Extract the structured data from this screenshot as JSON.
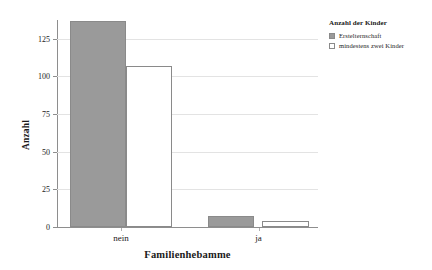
{
  "chart_data": {
    "type": "bar",
    "title": "",
    "xlabel": "Familienhebamme",
    "ylabel": "Anzahl",
    "categories": [
      "nein",
      "ja"
    ],
    "series": [
      {
        "name": "Erstelternschaft",
        "values": [
          137,
          7
        ],
        "swatch": "filled",
        "color": "#9a9a9a"
      },
      {
        "name": "mindestens zwei Kinder",
        "values": [
          107,
          4
        ],
        "swatch": "unfilled",
        "color": "#ffffff"
      }
    ],
    "ylim": [
      0,
      137.5
    ],
    "yticks": [
      0,
      25,
      50,
      75,
      100,
      125
    ],
    "ytick_labels": [
      "0",
      "25",
      "50",
      "75",
      "100",
      "125"
    ],
    "grid": true,
    "legend": {
      "title": "Anzahl der Kinder",
      "position": "right"
    }
  }
}
